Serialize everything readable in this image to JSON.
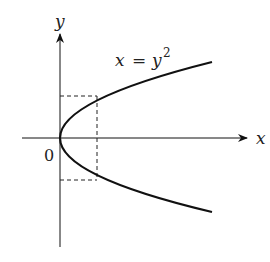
{
  "figure": {
    "equation_label": {
      "lhs": "x",
      "eq": "=",
      "rhs": "y",
      "exponent": "2"
    },
    "axis_x_label": "x",
    "axis_y_label": "y",
    "origin_label": "0",
    "colors": {
      "ink": "#111111",
      "label": "#222222",
      "background": "#ffffff"
    }
  }
}
